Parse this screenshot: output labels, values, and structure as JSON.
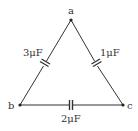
{
  "diagram": {
    "type": "capacitor-triangle-circuit",
    "nodes": [
      {
        "id": "a",
        "label": "a",
        "x": 71,
        "y": 20
      },
      {
        "id": "b",
        "label": "b",
        "x": 20,
        "y": 105
      },
      {
        "id": "c",
        "label": "c",
        "x": 123,
        "y": 105
      }
    ],
    "edges": [
      {
        "from": "a",
        "to": "b",
        "component": "capacitor",
        "label": "3μF"
      },
      {
        "from": "a",
        "to": "c",
        "component": "capacitor",
        "label": "1μF"
      },
      {
        "from": "b",
        "to": "c",
        "component": "capacitor",
        "label": "2μF"
      }
    ],
    "colors": {
      "line": "#333333",
      "background": "#ffffff"
    }
  }
}
